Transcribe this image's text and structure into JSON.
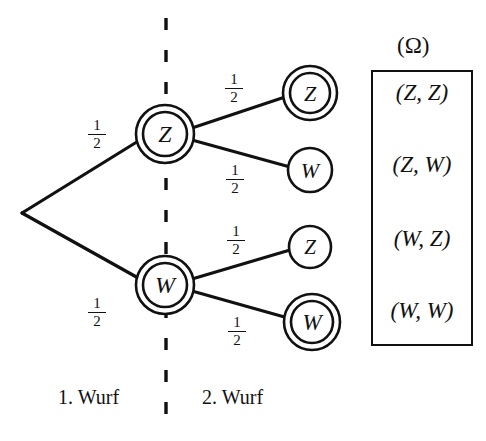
{
  "diagram": {
    "title_omega": "(Ω)",
    "stages": [
      {
        "label": "1. Wurf"
      },
      {
        "label": "2. Wurf"
      }
    ],
    "root": {
      "name": "root",
      "label": ""
    },
    "level1_nodes": [
      {
        "id": "z1",
        "label": "Z",
        "ring": "double",
        "cx": 165,
        "cy": 134,
        "r_outer": 29,
        "r_inner": 22
      },
      {
        "id": "w1",
        "label": "W",
        "ring": "double",
        "cx": 165,
        "cy": 285,
        "r_outer": 29,
        "r_inner": 22
      }
    ],
    "level2_nodes": [
      {
        "id": "z1z2",
        "label": "Z",
        "ring": "double",
        "cx": 310,
        "cy": 93,
        "r_outer": 27,
        "r_inner": 20
      },
      {
        "id": "z1w2",
        "label": "W",
        "ring": "single",
        "cx": 310,
        "cy": 170,
        "r_outer": 22,
        "r_inner": 0
      },
      {
        "id": "w1z2",
        "label": "Z",
        "ring": "single",
        "cx": 310,
        "cy": 247,
        "r_outer": 21,
        "r_inner": 0
      },
      {
        "id": "w1w2",
        "label": "W",
        "ring": "double",
        "cx": 312,
        "cy": 322,
        "r_outer": 28,
        "r_inner": 21
      }
    ],
    "edge_probabilities": [
      {
        "id": "p-root-z",
        "numerator": "1",
        "denominator": "2",
        "x": 86,
        "y": 118
      },
      {
        "id": "p-root-w",
        "numerator": "1",
        "denominator": "2",
        "x": 86,
        "y": 296
      },
      {
        "id": "p-z-z",
        "numerator": "1",
        "denominator": "2",
        "x": 223,
        "y": 72
      },
      {
        "id": "p-z-w",
        "numerator": "1",
        "denominator": "2",
        "x": 224,
        "y": 163
      },
      {
        "id": "p-w-z",
        "numerator": "1",
        "denominator": "2",
        "x": 225,
        "y": 224
      },
      {
        "id": "p-w-w",
        "numerator": "1",
        "denominator": "2",
        "x": 226,
        "y": 315
      }
    ],
    "outcomes": [
      {
        "id": "outcome-zz",
        "text": "(Z, Z)",
        "first": "Z",
        "second": "Z",
        "y": 84
      },
      {
        "id": "outcome-zw",
        "text": "(Z, W)",
        "first": "Z",
        "second": "W",
        "y": 155
      },
      {
        "id": "outcome-wz",
        "text": "(W, Z)",
        "first": "W",
        "second": "Z",
        "y": 228
      },
      {
        "id": "outcome-ww",
        "text": "(W, W)",
        "first": "W",
        "second": "W",
        "y": 300
      }
    ],
    "divider": {
      "name": "stage-divider",
      "x": 166,
      "dashed": true
    },
    "colors": {
      "ink": "#111111",
      "background": "#ffffff"
    }
  }
}
